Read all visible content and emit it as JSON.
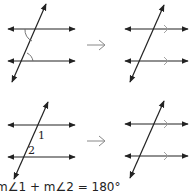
{
  "diagrams": [
    {
      "id": "top-left",
      "description": "Two parallel lines cut by a transversal with marked same-side interior angles"
    },
    {
      "id": "top-right",
      "description": "Parallel lines with parallel arrow marks"
    },
    {
      "id": "bottom-left",
      "description": "Two parallel lines cut by a transversal with angles labeled 1 and 2",
      "labels": [
        "1",
        "2"
      ]
    },
    {
      "id": "bottom-right",
      "description": "Parallel lines with parallel arrow marks"
    }
  ],
  "arrows": [
    "→",
    "→"
  ],
  "caption": "m∠1 + m∠2 = 180°",
  "labels": {
    "angle1": "1",
    "angle2": "2"
  },
  "colors": {
    "line": "#222222",
    "arc": "#444444",
    "arrow": "#777777"
  }
}
